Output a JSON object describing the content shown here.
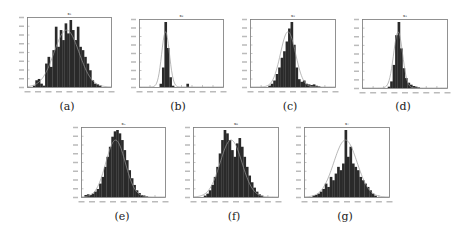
{
  "figure": {
    "panels": [
      {
        "id": "a",
        "caption": "(a)",
        "title": "x₁",
        "box": [
          27,
          17,
          85,
          71
        ],
        "caption_pos": [
          57,
          100
        ]
      },
      {
        "id": "b",
        "caption": "(b)",
        "title": "x₂",
        "box": [
          139,
          19,
          85,
          69
        ],
        "caption_pos": [
          168,
          100
        ]
      },
      {
        "id": "c",
        "caption": "(c)",
        "title": "x₃",
        "box": [
          250,
          19,
          86,
          69
        ],
        "caption_pos": [
          280,
          100
        ]
      },
      {
        "id": "d",
        "caption": "(d)",
        "title": "x₄",
        "box": [
          362,
          19,
          86,
          70
        ],
        "caption_pos": [
          393,
          100
        ]
      },
      {
        "id": "e",
        "caption": "(e)",
        "title": "x₅",
        "box": [
          81,
          127,
          85,
          71
        ],
        "caption_pos": [
          112,
          210
        ]
      },
      {
        "id": "f",
        "caption": "(f)",
        "title": "x₆",
        "box": [
          193,
          127,
          86,
          71
        ],
        "caption_pos": [
          224,
          210
        ]
      },
      {
        "id": "g",
        "caption": "(g)",
        "title": "x₇",
        "box": [
          304,
          127,
          86,
          71
        ],
        "caption_pos": [
          335,
          210
        ]
      }
    ]
  },
  "chart_data": [
    {
      "type": "bar",
      "title": "x₁",
      "caption": "(a)",
      "subtype": "histogram with fitted density curve",
      "xlabel": "",
      "ylabel": "",
      "grid": false,
      "legend": "none",
      "bins": [
        0,
        0,
        0.02,
        0.1,
        0.12,
        0.05,
        0.02,
        0.35,
        0.45,
        0.3,
        0.55,
        0.9,
        0.6,
        0.85,
        0.7,
        0.95,
        0.8,
        1.0,
        0.85,
        0.7,
        0.9,
        0.6,
        0.55,
        0.45,
        0.35,
        0.25,
        0.1,
        0.05,
        0.04,
        0.02,
        0,
        0,
        0,
        0
      ],
      "fit": "approximately normal, centered near 45% of x-range"
    },
    {
      "type": "bar",
      "title": "x₂",
      "caption": "(b)",
      "subtype": "histogram with fitted density curve",
      "xlabel": "",
      "ylabel": "",
      "grid": false,
      "legend": "none",
      "bins": [
        0,
        0,
        0,
        0,
        0,
        0,
        0,
        0,
        0.05,
        0.3,
        1.0,
        0.6,
        0.15,
        0.02,
        0,
        0,
        0,
        0,
        0,
        0.05,
        0,
        0,
        0,
        0,
        0,
        0,
        0,
        0,
        0,
        0,
        0,
        0,
        0,
        0
      ],
      "fit": "narrow normal peak near 25% of x-range"
    },
    {
      "type": "bar",
      "title": "x₃",
      "caption": "(c)",
      "subtype": "histogram with fitted density curve",
      "xlabel": "",
      "ylabel": "",
      "grid": false,
      "legend": "none",
      "bins": [
        0,
        0,
        0,
        0,
        0,
        0,
        0,
        0.02,
        0.05,
        0.1,
        0.2,
        0.3,
        0.45,
        0.55,
        0.7,
        0.9,
        1.0,
        0.65,
        0.3,
        0.12,
        0.08,
        0.1,
        0.05,
        0.04,
        0.03,
        0.04,
        0.02,
        0.01,
        0,
        0,
        0,
        0,
        0,
        0
      ],
      "fit": "skewed-right peak near 45% of x-range"
    },
    {
      "type": "bar",
      "title": "x₄",
      "caption": "(d)",
      "subtype": "histogram with fitted density curve",
      "xlabel": "",
      "ylabel": "",
      "grid": false,
      "legend": "none",
      "bins": [
        0,
        0,
        0,
        0,
        0,
        0,
        0,
        0,
        0,
        0,
        0.02,
        0.1,
        0.35,
        0.8,
        1.0,
        0.6,
        0.3,
        0.15,
        0.08,
        0.05,
        0.03,
        0.02,
        0.01,
        0,
        0,
        0,
        0,
        0,
        0,
        0,
        0,
        0,
        0,
        0
      ],
      "fit": "sharp peak near 35% of x-range, right tail"
    },
    {
      "type": "bar",
      "title": "x₅",
      "caption": "(e)",
      "subtype": "histogram with fitted density curve",
      "xlabel": "",
      "ylabel": "",
      "grid": false,
      "legend": "none",
      "bins": [
        0,
        0.03,
        0.04,
        0.03,
        0.05,
        0.08,
        0.12,
        0.2,
        0.3,
        0.45,
        0.6,
        0.75,
        0.9,
        0.98,
        1.0,
        0.95,
        0.85,
        0.7,
        0.55,
        0.4,
        0.28,
        0.18,
        0.1,
        0.06,
        0.03,
        0.02,
        0.01,
        0,
        0,
        0,
        0,
        0,
        0,
        0
      ],
      "fit": "smooth normal centered near 40% of x-range"
    },
    {
      "type": "bar",
      "title": "x₆",
      "caption": "(f)",
      "subtype": "histogram with fitted density curve",
      "xlabel": "",
      "ylabel": "",
      "grid": false,
      "legend": "none",
      "bins": [
        0,
        0,
        0,
        0,
        0.02,
        0.05,
        0.1,
        0.18,
        0.3,
        0.45,
        0.65,
        0.85,
        1.0,
        0.95,
        0.85,
        0.7,
        0.6,
        0.8,
        0.88,
        0.75,
        0.6,
        0.45,
        0.32,
        0.22,
        0.14,
        0.08,
        0.04,
        0.02,
        0,
        0,
        0,
        0,
        0,
        0
      ],
      "fit": "bimodal-looking histogram with single normal fit near 50% of x-range"
    },
    {
      "type": "bar",
      "title": "x₇",
      "caption": "(g)",
      "subtype": "histogram with fitted density curve",
      "xlabel": "",
      "ylabel": "",
      "grid": false,
      "legend": "none",
      "bins": [
        0,
        0,
        0,
        0.02,
        0.03,
        0.05,
        0.08,
        0.12,
        0.2,
        0.15,
        0.3,
        0.25,
        0.35,
        0.45,
        0.4,
        0.5,
        1.0,
        0.6,
        0.75,
        0.5,
        0.45,
        0.4,
        0.3,
        0.25,
        0.2,
        0.15,
        0.1,
        0.05,
        0.02,
        0,
        0,
        0,
        0,
        0
      ],
      "fit": "roughly normal with spiky peak near 50% of x-range"
    }
  ]
}
